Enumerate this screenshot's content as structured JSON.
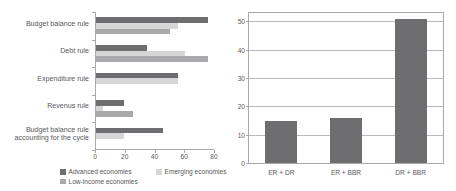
{
  "chart_data": [
    {
      "type": "bar",
      "orientation": "horizontal",
      "id": "fiscal-rules-by-income-group",
      "title": "",
      "xlabel": "",
      "ylabel": "",
      "xlim": [
        0,
        80
      ],
      "xticks": [
        0,
        20,
        40,
        60,
        80
      ],
      "grid": false,
      "legend_position": "bottom",
      "categories": [
        "Budget balance rule",
        "Debt rule",
        "Expenditure rule",
        "Revenus rule",
        "Budget balance rule accounting for the cycle"
      ],
      "categories_lines": [
        [
          "Budget balance rule"
        ],
        [
          "Debt rule"
        ],
        [
          "Expenditure rule"
        ],
        [
          "Revenus rule"
        ],
        [
          "Budget balance rule",
          "accounting for the cycle"
        ]
      ],
      "series": [
        {
          "name": "Advanced economies",
          "color": "#6e6e70",
          "values": [
            75,
            34,
            55,
            19,
            45
          ]
        },
        {
          "name": "Emerging economies",
          "color": "#d6d6d6",
          "values": [
            55,
            60,
            55,
            5,
            19
          ]
        },
        {
          "name": "Low-income economies",
          "color": "#a9a9ab",
          "values": [
            50,
            75,
            0,
            25,
            0
          ]
        }
      ]
    },
    {
      "type": "bar",
      "orientation": "vertical",
      "id": "rule-combinations",
      "title": "",
      "xlabel": "",
      "ylabel": "",
      "ylim": [
        0,
        53
      ],
      "yticks": [
        0,
        10,
        20,
        30,
        40,
        50
      ],
      "grid": true,
      "legend_position": "none",
      "categories": [
        "ER + DR",
        "ER + BBR",
        "DR + BBR"
      ],
      "values": [
        15,
        16,
        51
      ],
      "color": "#6e6e70"
    }
  ],
  "left_chart": {
    "axis_ticks": [
      "0",
      "20",
      "40",
      "60",
      "80"
    ],
    "legend": [
      "Advanced economies",
      "Emerging economies",
      "Low-income economies"
    ]
  },
  "right_chart": {
    "y_ticks": [
      "0",
      "10",
      "20",
      "30",
      "40",
      "50"
    ],
    "x_labels": [
      "ER + DR",
      "ER + BBR",
      "DR + BBR"
    ]
  }
}
